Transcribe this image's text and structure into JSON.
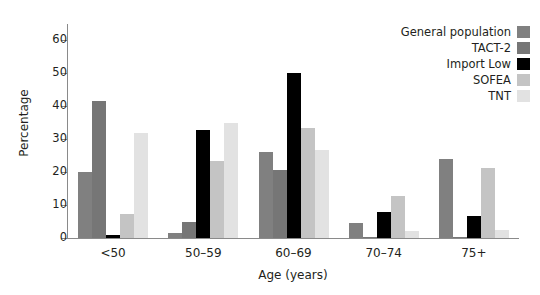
{
  "chart_data": {
    "type": "bar",
    "title": "",
    "xlabel": "Age (years)",
    "ylabel": "Percentage",
    "categories": [
      "<50",
      "50–59",
      "60–69",
      "70–74",
      "75+"
    ],
    "ylim": [
      0,
      65
    ],
    "yticks": [
      0,
      10,
      20,
      30,
      40,
      50,
      60
    ],
    "grid": false,
    "legend_position": "top-right",
    "series": [
      {
        "name": "General population",
        "color": "#808080",
        "values": [
          20.0,
          1.5,
          26.0,
          4.5,
          24.0
        ]
      },
      {
        "name": "TACT-2",
        "color": "#767676",
        "values": [
          41.5,
          5.0,
          20.8,
          0.4,
          0.3
        ]
      },
      {
        "name": "Import Low",
        "color": "#000000",
        "values": [
          1.0,
          32.8,
          50.0,
          7.9,
          6.8
        ]
      },
      {
        "name": "SOFEA",
        "color": "#c4c4c4",
        "values": [
          7.4,
          23.5,
          33.5,
          12.8,
          21.3
        ]
      },
      {
        "name": "TNT",
        "color": "#e2e2e2",
        "values": [
          32.0,
          35.0,
          26.8,
          2.1,
          2.3
        ]
      }
    ]
  },
  "axis": {
    "y_title": "Percentage",
    "x_title": "Age (years)",
    "y_tick_labels": [
      "0",
      "10",
      "20",
      "30",
      "40",
      "50",
      "60"
    ]
  },
  "legend": {
    "entries": [
      {
        "label": "General population",
        "color": "#808080"
      },
      {
        "label": "TACT-2",
        "color": "#767676"
      },
      {
        "label": "Import Low",
        "color": "#000000"
      },
      {
        "label": "SOFEA",
        "color": "#c4c4c4"
      },
      {
        "label": "TNT",
        "color": "#e2e2e2"
      }
    ]
  },
  "colors": {
    "axis": "#8a8a8a",
    "text": "#231f20",
    "background": "#ffffff"
  }
}
